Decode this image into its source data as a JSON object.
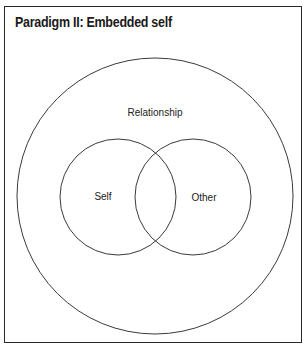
{
  "title": "Paradigm II: Embedded self",
  "diagram": {
    "type": "venn-nested",
    "outer": {
      "label": "Relationship"
    },
    "circles": [
      {
        "label": "Self"
      },
      {
        "label": "Other"
      }
    ],
    "stroke_color": "#3a3a3a",
    "border_color": "#2a2a2a"
  }
}
